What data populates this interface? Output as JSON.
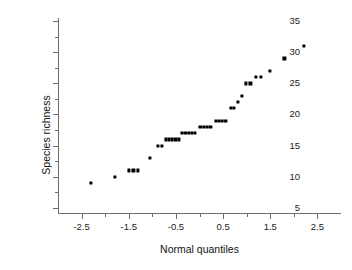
{
  "chart_data": {
    "type": "scatter",
    "title": "",
    "xlabel": "Normal quantiles",
    "ylabel": "Species richness",
    "xlim": [
      -3.0,
      3.0
    ],
    "ylim": [
      4.0,
      35.5
    ],
    "grid": false,
    "legend": null,
    "marker": "filled-square",
    "marker_color": "#000000",
    "xticks": [
      -2.5,
      -1.5,
      -0.5,
      0.5,
      1.5,
      2.5
    ],
    "xtick_labels": [
      "-2.5",
      "-1.5",
      "-0.5",
      "0.5",
      "1.5",
      "2.5"
    ],
    "xminor_ticks": [
      -2.0,
      -1.0,
      0.0,
      1.0,
      2.0
    ],
    "yticks": [
      5,
      10,
      15,
      20,
      25,
      30,
      35
    ],
    "ytick_labels": [
      "5",
      "10",
      "15",
      "20",
      "25",
      "30",
      "35"
    ],
    "yminor_ticks": [
      7.5,
      12.5,
      17.5,
      22.5,
      27.5,
      32.5
    ],
    "points": [
      {
        "x": -2.3,
        "y": 9
      },
      {
        "x": -1.79,
        "y": 10
      },
      {
        "x": -1.5,
        "y": 11
      },
      {
        "x": -1.4,
        "y": 11
      },
      {
        "x": -1.3,
        "y": 11
      },
      {
        "x": -1.06,
        "y": 13
      },
      {
        "x": -0.88,
        "y": 15
      },
      {
        "x": -0.8,
        "y": 15
      },
      {
        "x": -0.72,
        "y": 16
      },
      {
        "x": -0.65,
        "y": 16
      },
      {
        "x": -0.58,
        "y": 16
      },
      {
        "x": -0.51,
        "y": 16
      },
      {
        "x": -0.44,
        "y": 16
      },
      {
        "x": -0.37,
        "y": 17
      },
      {
        "x": -0.3,
        "y": 17
      },
      {
        "x": -0.23,
        "y": 17
      },
      {
        "x": -0.16,
        "y": 17
      },
      {
        "x": -0.09,
        "y": 17
      },
      {
        "x": 0.02,
        "y": 18
      },
      {
        "x": 0.09,
        "y": 18
      },
      {
        "x": 0.16,
        "y": 18
      },
      {
        "x": 0.23,
        "y": 18
      },
      {
        "x": 0.34,
        "y": 19
      },
      {
        "x": 0.41,
        "y": 19
      },
      {
        "x": 0.48,
        "y": 19
      },
      {
        "x": 0.55,
        "y": 19
      },
      {
        "x": 0.66,
        "y": 21
      },
      {
        "x": 0.73,
        "y": 21
      },
      {
        "x": 0.82,
        "y": 22
      },
      {
        "x": 0.9,
        "y": 23
      },
      {
        "x": 0.99,
        "y": 25
      },
      {
        "x": 1.08,
        "y": 25
      },
      {
        "x": 1.19,
        "y": 26
      },
      {
        "x": 1.31,
        "y": 26
      },
      {
        "x": 1.5,
        "y": 27
      },
      {
        "x": 1.8,
        "y": 29
      },
      {
        "x": 2.22,
        "y": 31
      }
    ]
  }
}
